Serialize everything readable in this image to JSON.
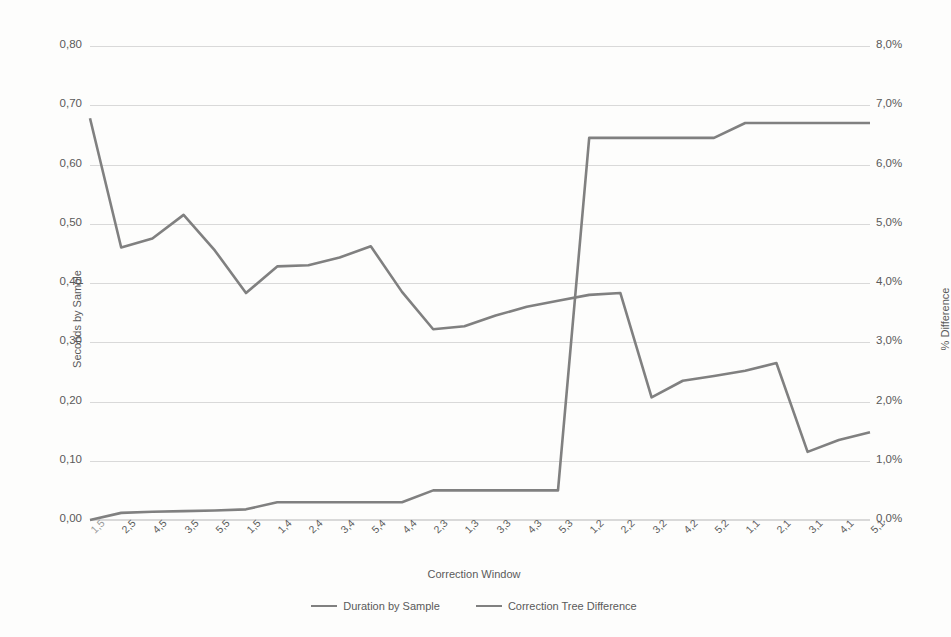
{
  "chart_data": {
    "type": "line",
    "title": "",
    "xlabel": "Correction Window",
    "ylabel": "Seconds by Sample",
    "y2label": "% Difference",
    "grid": true,
    "legend_position": "bottom",
    "categories": [
      "1,5",
      "2,5",
      "4,5",
      "3,5",
      "5,5",
      "1,5",
      "1,4",
      "2,4",
      "3,4",
      "5,4",
      "4,4",
      "2,3",
      "1,3",
      "3,3",
      "4,3",
      "5,3",
      "1,2",
      "2,2",
      "3,2",
      "4,2",
      "5,2",
      "1,1",
      "2,1",
      "3,1",
      "4,1",
      "5,1"
    ],
    "ylim": [
      0.0,
      0.8
    ],
    "yticks": [
      "0,00",
      "0,10",
      "0,20",
      "0,30",
      "0,40",
      "0,50",
      "0,60",
      "0,70",
      "0,80"
    ],
    "y2lim": [
      0.0,
      8.0
    ],
    "y2ticks": [
      "0,0%",
      "1,0%",
      "2,0%",
      "3,0%",
      "4,0%",
      "5,0%",
      "6,0%",
      "7,0%",
      "8,0%"
    ],
    "series": [
      {
        "name": "Duration by Sample",
        "axis": "left",
        "color": "#808080",
        "values": [
          0.678,
          0.46,
          0.475,
          0.515,
          0.455,
          0.383,
          0.428,
          0.43,
          0.443,
          0.462,
          0.385,
          0.322,
          0.327,
          0.345,
          0.36,
          0.37,
          0.38,
          0.383,
          0.207,
          0.235,
          0.243,
          0.252,
          0.265,
          0.115,
          0.135,
          0.148
        ]
      },
      {
        "name": "Correction Tree Difference",
        "axis": "right",
        "color": "#808080",
        "values": [
          0.0,
          0.12,
          0.14,
          0.15,
          0.16,
          0.18,
          0.3,
          0.3,
          0.3,
          0.3,
          0.3,
          0.5,
          0.5,
          0.5,
          0.5,
          0.5,
          6.45,
          6.45,
          6.45,
          6.45,
          6.45,
          6.7,
          6.7,
          6.7,
          6.7,
          6.7
        ]
      }
    ]
  },
  "legend": {
    "items": [
      {
        "label": "Duration by Sample"
      },
      {
        "label": "Correction Tree Difference"
      }
    ]
  }
}
